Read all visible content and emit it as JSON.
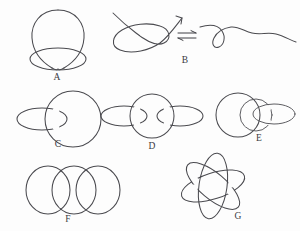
{
  "figure": {
    "background_color": "#fdfdfd",
    "stroke_color": "#4a4a4f",
    "width": 300,
    "height": 231
  },
  "panels": [
    {
      "id": "A",
      "label": "A",
      "label_x": 57,
      "label_y": 80,
      "description": "trefoil overhand knot with large vertical loop and small horizontal loop"
    },
    {
      "id": "B",
      "label": "B",
      "label_x": 185,
      "label_y": 63,
      "description": "figure-eight open knot in equilibrium with an unknotted wavy strand"
    },
    {
      "id": "C",
      "label": "C",
      "label_x": 58,
      "label_y": 147,
      "description": "Hopf link: one small ellipse interlocked with one large circle"
    },
    {
      "id": "D",
      "label": "D",
      "label_x": 152,
      "label_y": 149,
      "description": "chain of three interlocked rings, small-large-small"
    },
    {
      "id": "E",
      "label": "E",
      "label_x": 259,
      "label_y": 141,
      "description": "three overlapping rings of differing sizes interlocked in a row"
    },
    {
      "id": "F",
      "label": "F",
      "label_x": 68,
      "label_y": 222,
      "description": "Borromean-style arrangement of three overlapping circles in a row"
    },
    {
      "id": "G",
      "label": "G",
      "label_x": 238,
      "label_y": 219,
      "description": "three interlocked ellipses at different rotation angles, atom-like"
    }
  ],
  "symbols": {
    "equilibrium_arrow": {
      "name": "equilibrium-double-harpoon",
      "glyph": "⇌",
      "x": 186,
      "y": 36
    }
  }
}
